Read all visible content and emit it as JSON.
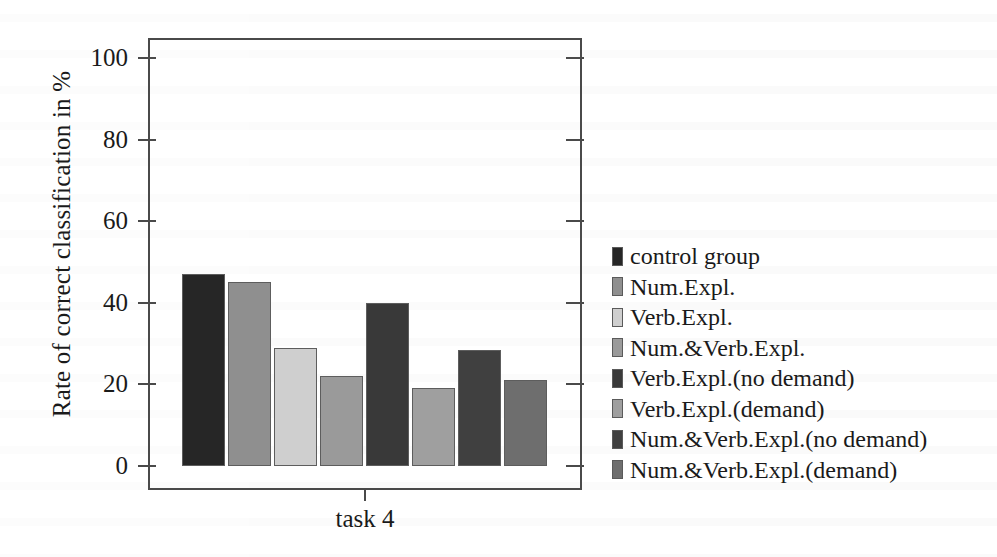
{
  "chart_data": {
    "type": "bar",
    "title": "",
    "subtitle": "",
    "xlabel": "task 4",
    "ylabel": "Rate of correct classification in %",
    "ylim": [
      0,
      100
    ],
    "yticks": [
      0,
      20,
      40,
      60,
      80,
      100
    ],
    "ytick_labels": [
      "0",
      "20",
      "40",
      "60",
      "80",
      "100"
    ],
    "xtick_labels": [
      "task 4"
    ],
    "grid": false,
    "legend_position": "right",
    "categories": [
      "control group",
      "Num.Expl.",
      "Verb.Expl.",
      "Num.&Verb.Expl.",
      "Verb.Expl.(no demand)",
      "Verb.Expl.(demand)",
      "Num.&Verb.Expl.(no demand)",
      "Num.&Verb.Expl.(demand)"
    ],
    "values": [
      47,
      45,
      29,
      22,
      40,
      19,
      28.5,
      21
    ],
    "colors": [
      "#262626",
      "#8f8f8f",
      "#cfcfcf",
      "#9a9a9a",
      "#393939",
      "#9f9f9f",
      "#404040",
      "#6e6e6e"
    ],
    "bar_edge_color": "#5d5d5d",
    "axis_color": "#4a4a4a"
  },
  "legend": {
    "items": [
      {
        "label": "control group",
        "color": "#262626"
      },
      {
        "label": "Num.Expl.",
        "color": "#8f8f8f"
      },
      {
        "label": "Verb.Expl.",
        "color": "#cfcfcf"
      },
      {
        "label": "Num.&Verb.Expl.",
        "color": "#9a9a9a"
      },
      {
        "label": "Verb.Expl.(no demand)",
        "color": "#393939"
      },
      {
        "label": "Verb.Expl.(demand)",
        "color": "#9f9f9f"
      },
      {
        "label": "Num.&Verb.Expl.(no demand)",
        "color": "#404040"
      },
      {
        "label": "Num.&Verb.Expl.(demand)",
        "color": "#6e6e6e"
      }
    ]
  }
}
